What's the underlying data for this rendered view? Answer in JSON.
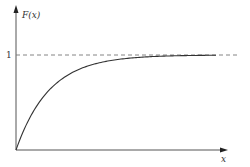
{
  "chart_data": {
    "type": "line",
    "title": "",
    "xlabel": "x",
    "ylabel": "F(x)",
    "ytick_labels": [
      "1"
    ],
    "asymptote": {
      "y": 1,
      "style": "dashed"
    },
    "grid": false,
    "legend": null,
    "function": "F(x) = 1 - e^(-kx)",
    "series": [
      {
        "name": "F(x)",
        "x": [
          0,
          0.5,
          1,
          1.5,
          2,
          2.5,
          3,
          3.5,
          4,
          5,
          6
        ],
        "y": [
          0,
          0.39,
          0.63,
          0.78,
          0.86,
          0.92,
          0.95,
          0.97,
          0.98,
          0.99,
          1.0
        ]
      }
    ],
    "xlim": [
      0,
      6
    ],
    "ylim": [
      0,
      1.5
    ]
  },
  "labels": {
    "y_axis": "F(x)",
    "x_axis": "x",
    "one": "1"
  }
}
